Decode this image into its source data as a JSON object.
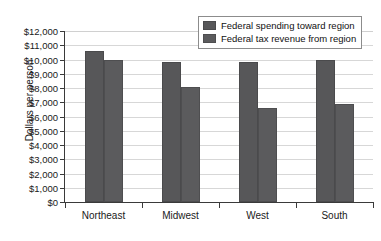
{
  "chart_data": {
    "type": "bar",
    "title": "",
    "xlabel": "",
    "ylabel": "Dollars per person",
    "categories": [
      "Northeast",
      "Midwest",
      "West",
      "South"
    ],
    "series": [
      {
        "name": "Federal spending toward region",
        "values": [
          10600,
          9800,
          9800,
          10000
        ],
        "color": "#575759"
      },
      {
        "name": "Federal tax revenue from region",
        "values": [
          9950,
          8050,
          6600,
          6900
        ],
        "color": "#5b5b5d"
      }
    ],
    "ylim": [
      0,
      12000
    ],
    "ytick_values": [
      0,
      1000,
      2000,
      3000,
      4000,
      5000,
      6000,
      7000,
      8000,
      9000,
      10000,
      11000,
      12000
    ],
    "ytick_labels": [
      "$0",
      "$1,000",
      "$2,000",
      "$3,000",
      "$4,000",
      "$5,000",
      "$6,000",
      "$7,000",
      "$8,000",
      "$9,000",
      "$10,000",
      "$11,000",
      "$12,000"
    ],
    "grid": true,
    "legend_position": "top-right",
    "background_color": "#ffffff",
    "axis_color": "#3a3a3a",
    "grid_color": "#d7d7d7"
  }
}
